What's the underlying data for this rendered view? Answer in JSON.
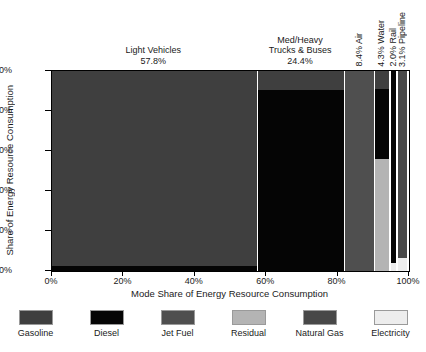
{
  "chart_data": {
    "type": "bar",
    "subtype": "mosaic-marimekko-stacked",
    "title": "",
    "xlabel": "Mode Share of Energy Resource Consumption",
    "ylabel": "Share of Energy Resource Consumption",
    "xlim": [
      0,
      100
    ],
    "ylim": [
      0,
      100
    ],
    "grid": false,
    "legend_position": "bottom",
    "xticks": [
      "0%",
      "20%",
      "40%",
      "60%",
      "80%",
      "100%"
    ],
    "xtick_values": [
      0,
      20,
      40,
      60,
      80,
      100
    ],
    "yticks": [
      "0%",
      "20%",
      "40%",
      "60%",
      "80%",
      "100%"
    ],
    "ytick_values": [
      0,
      20,
      40,
      60,
      80,
      100
    ],
    "legend": [
      {
        "name": "Gasoline",
        "color": "#3f3f3f"
      },
      {
        "name": "Diesel",
        "color": "#050505"
      },
      {
        "name": "Jet Fuel",
        "color": "#4f4f4f"
      },
      {
        "name": "Residual",
        "color": "#b4b4b4"
      },
      {
        "name": "Natural Gas",
        "color": "#484848"
      },
      {
        "name": "Electricity",
        "color": "#ededed"
      }
    ],
    "categories": [
      {
        "label": "Light Vehicles",
        "share_label": "57.8%",
        "share": 57.8,
        "label_orientation": "horizontal",
        "segments": [
          {
            "fuel": "Gasoline",
            "value": 97.5,
            "color": "#3f3f3f"
          },
          {
            "fuel": "Diesel",
            "value": 2.5,
            "color": "#050505"
          }
        ]
      },
      {
        "label": "Med/Heavy\nTrucks & Buses",
        "label_line1": "Med/Heavy",
        "label_line2": "Trucks & Buses",
        "share_label": "24.4%",
        "share": 24.4,
        "label_orientation": "horizontal",
        "segments": [
          {
            "fuel": "Gasoline",
            "value": 9.5,
            "color": "#3f3f3f"
          },
          {
            "fuel": "Diesel",
            "value": 90.5,
            "color": "#050505"
          }
        ]
      },
      {
        "label": "8.4% Air",
        "share_label": "8.4%",
        "share": 8.4,
        "label_orientation": "vertical",
        "segments": [
          {
            "fuel": "Jet Fuel",
            "value": 100.0,
            "color": "#4f4f4f"
          }
        ]
      },
      {
        "label": "4.3% Water",
        "share_label": "4.3%",
        "share": 4.3,
        "label_orientation": "vertical",
        "segments": [
          {
            "fuel": "Gasoline",
            "value": 9.0,
            "color": "#3f3f3f"
          },
          {
            "fuel": "Diesel",
            "value": 35.0,
            "color": "#050505"
          },
          {
            "fuel": "Residual",
            "value": 56.0,
            "color": "#b4b4b4"
          }
        ]
      },
      {
        "label": "2.0% Rail",
        "share_label": "2.0%",
        "share": 2.0,
        "label_orientation": "vertical",
        "segments": [
          {
            "fuel": "Diesel",
            "value": 96.0,
            "color": "#050505"
          },
          {
            "fuel": "Electricity",
            "value": 4.0,
            "color": "#ededed"
          }
        ]
      },
      {
        "label": "3.1% Pipeline",
        "share_label": "3.1%",
        "share": 3.1,
        "label_orientation": "vertical",
        "segments": [
          {
            "fuel": "Natural Gas",
            "value": 93.5,
            "color": "#484848"
          },
          {
            "fuel": "Electricity",
            "value": 6.5,
            "color": "#ededed"
          }
        ]
      }
    ]
  }
}
